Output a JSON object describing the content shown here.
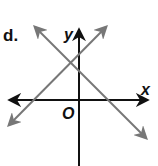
{
  "problem": {
    "label": "d."
  },
  "axes": {
    "x_label": "x",
    "y_label": "y",
    "origin_label": "O",
    "color": "#111111"
  },
  "lines": [
    {
      "name": "descending-line",
      "slope_sign": "negative",
      "color": "#777777"
    },
    {
      "name": "ascending-line",
      "slope_sign": "positive",
      "color": "#777777"
    }
  ]
}
